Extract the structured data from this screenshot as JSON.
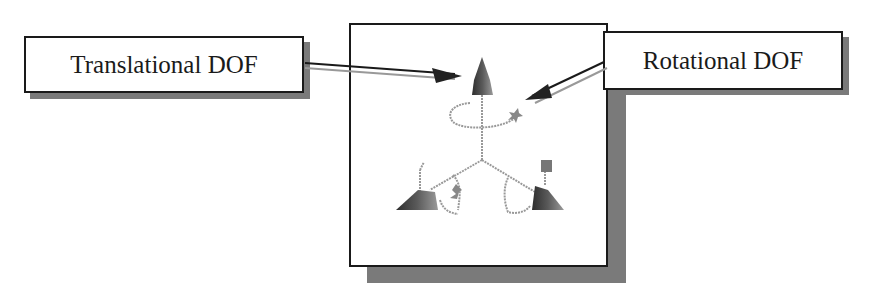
{
  "diagram": {
    "labels": {
      "translational": "Translational DOF",
      "rotational": "Rotational DOF"
    },
    "colors": {
      "border": "#1a1a1a",
      "shadow": "#7a7a7a",
      "glyph_dark": "#3a3a3a",
      "glyph_mid": "#8a8a8a",
      "curve": "#999999"
    }
  }
}
